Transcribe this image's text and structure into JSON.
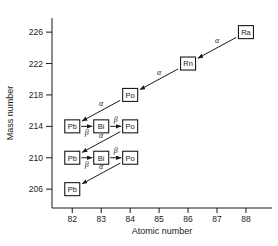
{
  "chart_data": {
    "type": "scatter",
    "title": "",
    "xlabel": "Atomic number",
    "ylabel": "Mass number",
    "xlim": [
      81.3,
      88.9
    ],
    "ylim": [
      203.6,
      227.8
    ],
    "xticks": [
      82,
      83,
      84,
      85,
      86,
      87,
      88
    ],
    "xtick_labels": [
      "82",
      "83",
      "84",
      "85",
      "86",
      "87",
      "88"
    ],
    "yticks": [
      206,
      210,
      214,
      218,
      222,
      226
    ],
    "ytick_labels": [
      "206",
      "210",
      "214",
      "218",
      "222",
      "226"
    ],
    "grid": false,
    "legend": false,
    "nodes": [
      {
        "label": "Ra",
        "x": 88,
        "y": 226
      },
      {
        "label": "Rn",
        "x": 86,
        "y": 222
      },
      {
        "label": "Po",
        "x": 84,
        "y": 218
      },
      {
        "label": "Pb",
        "x": 82,
        "y": 214
      },
      {
        "label": "Bi",
        "x": 83,
        "y": 214
      },
      {
        "label": "Po",
        "x": 84,
        "y": 214
      },
      {
        "label": "Pb",
        "x": 82,
        "y": 210
      },
      {
        "label": "Bi",
        "x": 83,
        "y": 210
      },
      {
        "label": "Po",
        "x": 84,
        "y": 210
      },
      {
        "label": "Pb",
        "x": 82,
        "y": 206
      }
    ],
    "edges": [
      {
        "from": "Ra-226",
        "to": "Rn-222",
        "x1": 88,
        "y1": 226,
        "x2": 86,
        "y2": 222,
        "label": "α",
        "label_side": "above"
      },
      {
        "from": "Rn-222",
        "to": "Po-218",
        "x1": 86,
        "y1": 222,
        "x2": 84,
        "y2": 218,
        "label": "α",
        "label_side": "above"
      },
      {
        "from": "Po-218",
        "to": "Pb-214",
        "x1": 84,
        "y1": 218,
        "x2": 82,
        "y2": 214,
        "label": "α",
        "label_side": "above"
      },
      {
        "from": "Pb-214",
        "to": "Bi-214",
        "x1": 82,
        "y1": 214,
        "x2": 83,
        "y2": 214,
        "label": "β",
        "label_side": "below"
      },
      {
        "from": "Bi-214",
        "to": "Po-214",
        "x1": 83,
        "y1": 214,
        "x2": 84,
        "y2": 214,
        "label": "β",
        "label_side": "above"
      },
      {
        "from": "Po-214",
        "to": "Pb-210",
        "x1": 84,
        "y1": 214,
        "x2": 82,
        "y2": 210,
        "label": "α",
        "label_side": "above"
      },
      {
        "from": "Pb-210",
        "to": "Bi-210",
        "x1": 82,
        "y1": 210,
        "x2": 83,
        "y2": 210,
        "label": "β",
        "label_side": "below"
      },
      {
        "from": "Bi-210",
        "to": "Po-210",
        "x1": 83,
        "y1": 210,
        "x2": 84,
        "y2": 210,
        "label": "β",
        "label_side": "above"
      },
      {
        "from": "Po-210",
        "to": "Pb-206",
        "x1": 84,
        "y1": 210,
        "x2": 82,
        "y2": 206,
        "label": "α",
        "label_side": "above"
      }
    ],
    "colors": {
      "axis": "#1a1a1a",
      "arrow": "#1a1a1a",
      "box_fill": "#ffffff",
      "box_stroke": "#1a1a1a",
      "text": "#1a1a1a",
      "background": "#ffffff"
    }
  }
}
